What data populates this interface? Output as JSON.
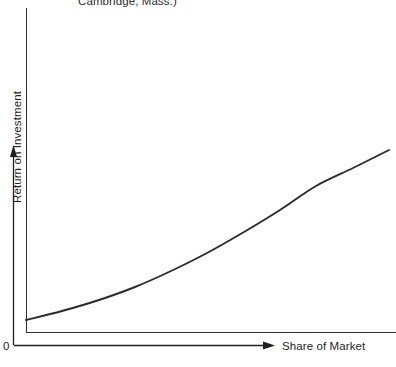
{
  "figure": {
    "caption_fragment": "Cambridge, Mass.)",
    "origin_label": "0",
    "background_color": "#ffffff",
    "line_color": "#2b2b2b",
    "axis_color": "#2e2e2e"
  },
  "chart_data": {
    "type": "line",
    "title": "",
    "subtitle": "",
    "caption_fragment": "Cambridge, Mass.)",
    "xlabel": "Share of Market",
    "ylabel": "Return on Investment",
    "grid": false,
    "legend": null,
    "axis_ticks": {
      "x": [
        "0"
      ],
      "y": []
    },
    "axis_arrows": {
      "x": "right",
      "y": "up"
    },
    "xlim": [
      0,
      1
    ],
    "ylim": [
      0,
      1
    ],
    "annotations": [],
    "series": [
      {
        "name": "Return on Investment vs Share of Market",
        "color": "#2b2b2b",
        "x": [
          0.0,
          0.1,
          0.2,
          0.3,
          0.4,
          0.5,
          0.6,
          0.7,
          0.8,
          0.9,
          1.0
        ],
        "y": [
          0.04,
          0.075,
          0.12,
          0.175,
          0.24,
          0.315,
          0.4,
          0.49,
          0.585,
          0.685,
          0.79
        ],
        "x_pixels": [
          26,
          62,
          99,
          135,
          171,
          207,
          244,
          280,
          316,
          353,
          389
        ],
        "y_pixels": [
          320,
          311,
          300,
          287,
          271,
          253,
          232,
          210,
          186,
          168,
          150
        ]
      }
    ]
  }
}
